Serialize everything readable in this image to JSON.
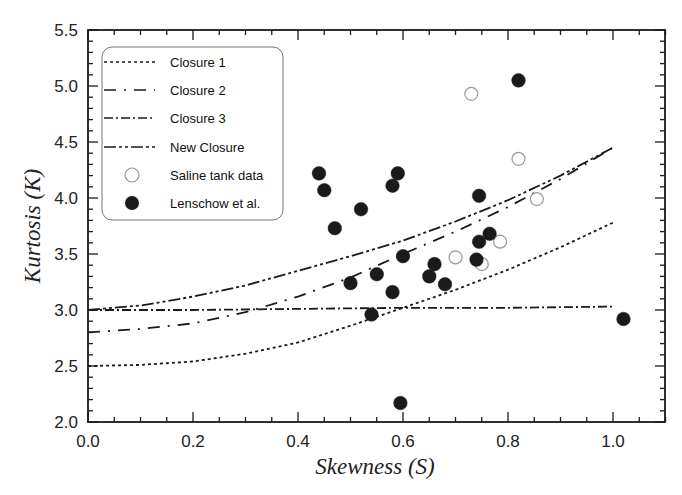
{
  "chart_data": {
    "type": "scatter",
    "title": "",
    "xlabel": "Skewness (S)",
    "ylabel": "Kurtosis (K)",
    "xlim": [
      0.0,
      1.1
    ],
    "ylim": [
      2.0,
      5.5
    ],
    "x_ticks": [
      "0.0",
      "0.2",
      "0.4",
      "0.6",
      "0.8",
      "1.0"
    ],
    "y_ticks": [
      "2.0",
      "2.5",
      "3.0",
      "3.5",
      "4.0",
      "4.5",
      "5.0",
      "5.5"
    ],
    "grid": false,
    "legend_position": "upper-left",
    "series": [
      {
        "name": "Closure 1",
        "kind": "line",
        "style": "dotted",
        "x": [
          0.0,
          0.1,
          0.2,
          0.3,
          0.4,
          0.5,
          0.6,
          0.7,
          0.8,
          0.9,
          1.0
        ],
        "y": [
          2.5,
          2.51,
          2.54,
          2.61,
          2.71,
          2.86,
          3.02,
          3.18,
          3.36,
          3.56,
          3.78
        ]
      },
      {
        "name": "Closure 2",
        "kind": "line",
        "style": "long-dash-dot",
        "x": [
          0.0,
          0.1,
          0.2,
          0.3,
          0.4,
          0.5,
          0.6,
          0.7,
          0.8,
          0.9,
          1.0
        ],
        "y": [
          2.8,
          2.83,
          2.88,
          2.98,
          3.12,
          3.29,
          3.5,
          3.7,
          3.92,
          4.17,
          4.45
        ]
      },
      {
        "name": "Closure 3",
        "kind": "line",
        "style": "dash-dot",
        "x": [
          0.0,
          0.2,
          0.4,
          0.6,
          0.8,
          1.0
        ],
        "y": [
          3.0,
          3.0,
          3.01,
          3.02,
          3.02,
          3.03
        ]
      },
      {
        "name": "New Closure",
        "kind": "line",
        "style": "dash-dot-dot",
        "x": [
          0.0,
          0.1,
          0.2,
          0.3,
          0.4,
          0.5,
          0.6,
          0.7,
          0.8,
          0.9,
          1.0
        ],
        "y": [
          3.0,
          3.04,
          3.12,
          3.22,
          3.35,
          3.48,
          3.62,
          3.79,
          3.98,
          4.2,
          4.45
        ]
      },
      {
        "name": "Saline tank data",
        "kind": "points",
        "marker": "open-circle",
        "x": [
          0.73,
          0.82,
          0.855,
          0.7,
          0.75,
          0.785
        ],
        "y": [
          4.93,
          4.35,
          3.99,
          3.47,
          3.41,
          3.61
        ]
      },
      {
        "name": "Lenschow et al.",
        "kind": "points",
        "marker": "filled-circle",
        "x": [
          0.82,
          0.44,
          0.45,
          0.59,
          0.58,
          0.52,
          0.47,
          0.745,
          0.765,
          0.745,
          0.6,
          0.66,
          0.74,
          0.65,
          0.55,
          0.5,
          0.68,
          0.58,
          0.54,
          0.595,
          1.02
        ],
        "y": [
          5.05,
          4.22,
          4.07,
          4.22,
          4.11,
          3.9,
          3.73,
          4.02,
          3.68,
          3.61,
          3.48,
          3.41,
          3.45,
          3.3,
          3.32,
          3.24,
          3.23,
          3.16,
          2.96,
          2.17,
          2.92
        ]
      }
    ]
  },
  "legend": {
    "items": [
      {
        "label": "Closure 1"
      },
      {
        "label": "Closure 2"
      },
      {
        "label": "Closure 3"
      },
      {
        "label": "New Closure"
      },
      {
        "label": "Saline tank data"
      },
      {
        "label": "Lenschow et al."
      }
    ]
  },
  "axes": {
    "x_title": "Skewness (S)",
    "y_title": "Kurtosis (K)"
  },
  "colors": {
    "ink": "#1a1a1a",
    "background": "#ffffff",
    "open_marker_stroke": "#9a9a9a"
  }
}
